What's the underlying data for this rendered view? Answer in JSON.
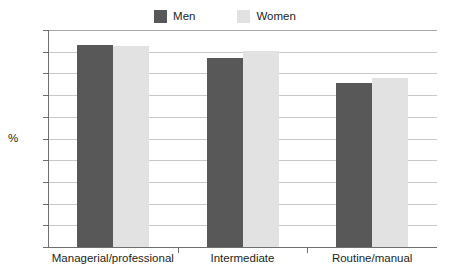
{
  "chart_data": {
    "type": "bar",
    "title": "",
    "subtitle": "",
    "xlabel": "",
    "ylabel": "%",
    "ylim": [
      0,
      100
    ],
    "ytick_step": 10,
    "yticks": [
      100,
      90,
      80,
      70,
      60,
      50,
      40,
      30,
      20,
      10,
      0
    ],
    "categories": [
      "Managerial/professional",
      "Intermediate",
      "Routine/manual"
    ],
    "grid": true,
    "legend_position": "top-center",
    "series": [
      {
        "name": "Men",
        "color": "#585858",
        "values": [
          93,
          87,
          75.5
        ]
      },
      {
        "name": "Women",
        "color": "#e2e2e2",
        "values": [
          92.5,
          90.5,
          78
        ]
      }
    ]
  },
  "legend": {
    "entries": [
      {
        "label": "Men",
        "swatch_color": "#585858"
      },
      {
        "label": "Women",
        "swatch_color": "#e2e2e2"
      }
    ]
  },
  "axes": {
    "y_axis_title": "%",
    "y_tick_labels": [
      "100",
      "90",
      "80",
      "70",
      "60",
      "50",
      "40",
      "30",
      "20",
      "10",
      "0"
    ],
    "x_tick_labels": [
      "Managerial/professional",
      "Intermediate",
      "Routine/manual"
    ]
  },
  "colors": {
    "men_bar": "#585858",
    "women_bar": "#e2e2e2",
    "gridline": "#c9c9c9",
    "axis_line": "#6f6f6f",
    "text": "#231f20",
    "background": "#ffffff"
  }
}
